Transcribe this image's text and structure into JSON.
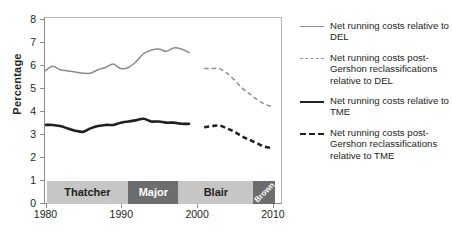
{
  "chart_data": {
    "type": "line",
    "title": "",
    "xlabel": "",
    "ylabel": "Percentage",
    "xlim": [
      1980,
      2011
    ],
    "ylim": [
      0,
      8
    ],
    "yticks": [
      0,
      1,
      2,
      3,
      4,
      5,
      6,
      7,
      8
    ],
    "xticks": [
      1980,
      1990,
      2000,
      2010
    ],
    "grid": false,
    "legend_position": "right",
    "series": [
      {
        "name": "Net running costs relative to DEL",
        "style": "solid",
        "color": "#8c8c8c",
        "width": "thin",
        "x": [
          1980,
          1981,
          1982,
          1983,
          1984,
          1985,
          1986,
          1987,
          1988,
          1989,
          1990,
          1991,
          1992,
          1993,
          1994,
          1995,
          1996,
          1997,
          1998,
          1999
        ],
        "y": [
          5.7,
          5.9,
          5.75,
          5.7,
          5.65,
          5.6,
          5.6,
          5.75,
          5.85,
          6.0,
          5.8,
          5.85,
          6.1,
          6.45,
          6.6,
          6.65,
          6.55,
          6.7,
          6.65,
          6.5
        ]
      },
      {
        "name": "Net running costs post-Gershon reclassifications relative to DEL",
        "style": "dashed",
        "color": "#8c8c8c",
        "width": "thin",
        "x": [
          2001,
          2002,
          2003,
          2004,
          2005,
          2006,
          2007,
          2008,
          2009,
          2010
        ],
        "y": [
          5.8,
          5.8,
          5.8,
          5.6,
          5.3,
          4.95,
          4.7,
          4.45,
          4.25,
          4.15
        ]
      },
      {
        "name": "Net running costs relative to TME",
        "style": "solid",
        "color": "#231f20",
        "width": "thick",
        "x": [
          1980,
          1981,
          1982,
          1983,
          1984,
          1985,
          1986,
          1987,
          1988,
          1989,
          1990,
          1991,
          1992,
          1993,
          1994,
          1995,
          1996,
          1997,
          1998,
          1999
        ],
        "y": [
          3.35,
          3.35,
          3.3,
          3.2,
          3.1,
          3.05,
          3.2,
          3.3,
          3.35,
          3.35,
          3.45,
          3.5,
          3.55,
          3.62,
          3.5,
          3.5,
          3.45,
          3.45,
          3.4,
          3.4
        ]
      },
      {
        "name": "Net running costs post-Gershon reclassifications relative to TME",
        "style": "dashed",
        "color": "#231f20",
        "width": "thick",
        "x": [
          2001,
          2002,
          2003,
          2004,
          2005,
          2006,
          2007,
          2008,
          2009,
          2010
        ],
        "y": [
          3.25,
          3.3,
          3.32,
          3.2,
          3.05,
          2.85,
          2.7,
          2.55,
          2.4,
          2.35
        ]
      }
    ],
    "bands": [
      {
        "label": "Thatcher",
        "start": 1980,
        "end": 1990.8,
        "shade": "light",
        "rotated": false
      },
      {
        "label": "Major",
        "start": 1990.8,
        "end": 1997.4,
        "shade": "dark",
        "rotated": false
      },
      {
        "label": "Blair",
        "start": 1997.4,
        "end": 2007.3,
        "shade": "light",
        "rotated": false
      },
      {
        "label": "Brown",
        "start": 2007.3,
        "end": 2010.2,
        "shade": "dark",
        "rotated": true
      }
    ]
  },
  "legend": {
    "items": [
      {
        "marker": "gray-solid",
        "label": "Net running costs relative to DEL"
      },
      {
        "marker": "gray-dash",
        "label": "Net running costs post-Gershon reclassifications relative to DEL"
      },
      {
        "marker": "black-solid",
        "label": "Net running costs relative to TME"
      },
      {
        "marker": "black-dash",
        "label": "Net running costs post-Gershon reclassifications relative to TME"
      }
    ]
  },
  "axis": {
    "ylabel": "Percentage",
    "ytick_labels": [
      "0",
      "1",
      "2",
      "3",
      "4",
      "5",
      "6",
      "7",
      "8"
    ],
    "xtick_labels": [
      "1980",
      "1990",
      "2000",
      "2010"
    ]
  },
  "colors": {
    "gray_series": "#8c8c8c",
    "black_series": "#231f20",
    "band_light": "#c6c6c6",
    "band_dark": "#6d6d6d",
    "axis": "#8c8c8c"
  }
}
